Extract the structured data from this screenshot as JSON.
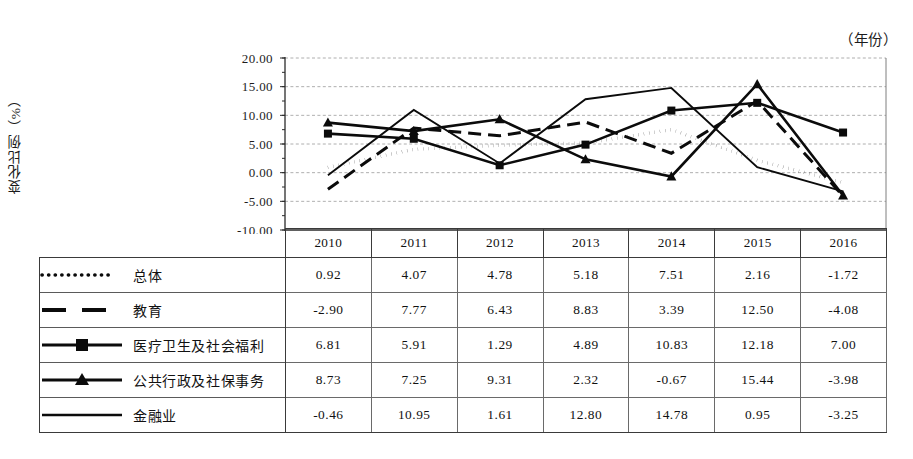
{
  "year_caption": "（年份）",
  "y_axis_title": "变化比例（%）",
  "chart_data": {
    "type": "line",
    "title": "",
    "xlabel": "（年份）",
    "ylabel": "变化比例（%）",
    "categories": [
      "2010",
      "2011",
      "2012",
      "2013",
      "2014",
      "2015",
      "2016"
    ],
    "ylim": [
      -10.0,
      20.0
    ],
    "ytick_labels": [
      "20.00",
      "15.00",
      "10.00",
      "5.00",
      "0.00",
      "-5.00",
      "-10.00"
    ],
    "ytick_values": [
      20,
      15,
      10,
      5,
      0,
      -5,
      -10
    ],
    "grid": true,
    "legend_position": "table-left",
    "series": [
      {
        "name": "总体",
        "style": "dotted",
        "marker": "none",
        "values": [
          0.92,
          4.07,
          4.78,
          5.18,
          7.51,
          2.16,
          -1.72
        ]
      },
      {
        "name": "教育",
        "style": "dashed",
        "marker": "none",
        "values": [
          -2.9,
          7.77,
          6.43,
          8.83,
          3.39,
          12.5,
          -4.08
        ]
      },
      {
        "name": "医疗卫生及社会福利",
        "style": "solid-marker",
        "marker": "square",
        "values": [
          6.81,
          5.91,
          1.29,
          4.89,
          10.83,
          12.18,
          7.0
        ]
      },
      {
        "name": "公共行政及社保事务",
        "style": "solid-marker",
        "marker": "triangle",
        "values": [
          8.73,
          7.25,
          9.31,
          2.32,
          -0.67,
          15.44,
          -3.98
        ]
      },
      {
        "name": "金融业",
        "style": "solid",
        "marker": "none",
        "values": [
          -0.46,
          10.95,
          1.61,
          12.8,
          14.78,
          0.95,
          -3.25
        ]
      }
    ]
  },
  "table": {
    "year_headers": [
      "2010",
      "2011",
      "2012",
      "2013",
      "2014",
      "2015",
      "2016"
    ],
    "rows": [
      {
        "label": "总体",
        "values": [
          "0.92",
          "4.07",
          "4.78",
          "5.18",
          "7.51",
          "2.16",
          "-1.72"
        ]
      },
      {
        "label": "教育",
        "values": [
          "-2.90",
          "7.77",
          "6.43",
          "8.83",
          "3.39",
          "12.50",
          "-4.08"
        ]
      },
      {
        "label": "医疗卫生及社会福利",
        "values": [
          "6.81",
          "5.91",
          "1.29",
          "4.89",
          "10.83",
          "12.18",
          "7.00"
        ]
      },
      {
        "label": "公共行政及社保事务",
        "values": [
          "8.73",
          "7.25",
          "9.31",
          "2.32",
          "-0.67",
          "15.44",
          "-3.98"
        ]
      },
      {
        "label": "金融业",
        "values": [
          "-0.46",
          "10.95",
          "1.61",
          "12.80",
          "14.78",
          "0.95",
          "-3.25"
        ]
      }
    ]
  },
  "colors": {
    "ink": "#0b0b0b",
    "grid": "#9a9a9a",
    "border": "#3a3a3a"
  }
}
